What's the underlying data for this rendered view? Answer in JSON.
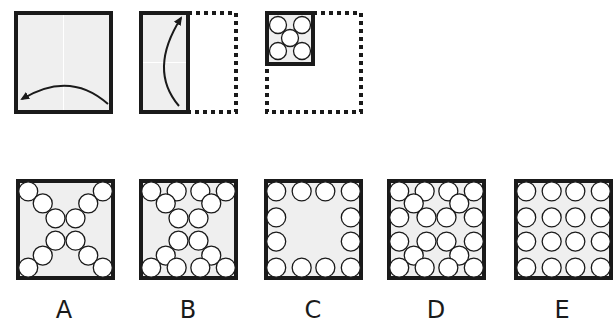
{
  "puzzle": {
    "type": "paper-folding",
    "colors": {
      "paper": "#efefef",
      "stroke": "#1a1a1a",
      "hole": "#ffffff"
    },
    "steps": [
      {
        "name": "step-1-fold-right-to-left",
        "description": "Square paper; right half folded over to the left"
      },
      {
        "name": "step-2-fold-bottom-to-top",
        "description": "Half-width strip; bottom half folded up to the top"
      },
      {
        "name": "step-3-punch-holes",
        "description": "Quarter-size folded square with 5 holes punched (4 corners + center)",
        "holes": 5
      }
    ],
    "options": [
      {
        "label": "A",
        "hole_count": 12
      },
      {
        "label": "B",
        "hole_count": 16
      },
      {
        "label": "C",
        "hole_count": 12
      },
      {
        "label": "D",
        "hole_count": 20
      },
      {
        "label": "E",
        "hole_count": 16
      }
    ]
  }
}
